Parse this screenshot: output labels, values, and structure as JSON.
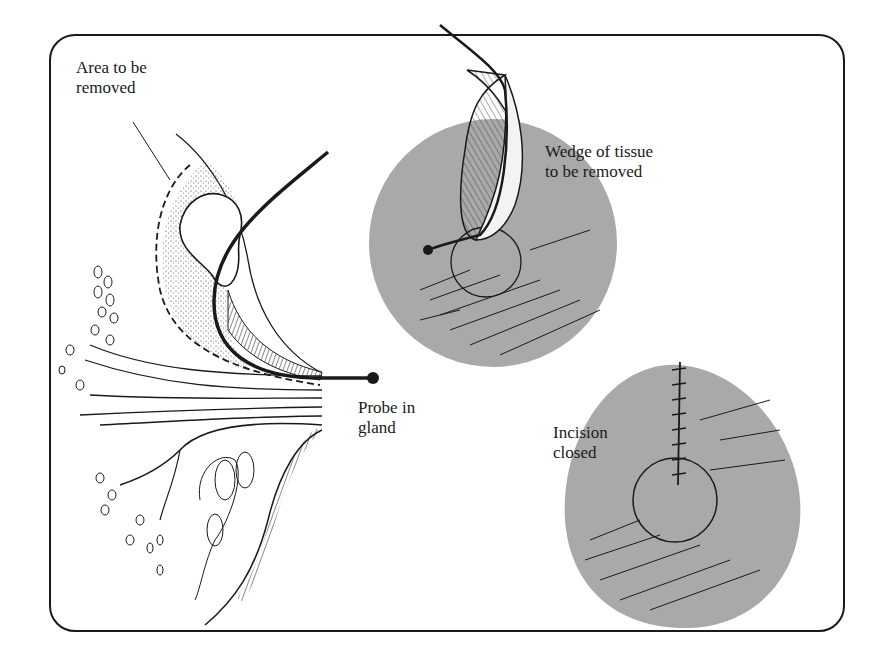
{
  "figure": {
    "panels": [
      {
        "id": "cross-section",
        "description": "Breast cross-section with probe inserted in duct"
      },
      {
        "id": "wedge-excision",
        "description": "Areola view with wedge of tissue being removed"
      },
      {
        "id": "closure",
        "description": "Areola view with sutured incision"
      }
    ],
    "labels": {
      "area_removed": "Area to be\nremoved",
      "wedge": "Wedge of tissue\nto be removed",
      "probe": "Probe in\ngland",
      "incision": "Incision\nclosed"
    },
    "colors": {
      "ink": "#1a1a1a",
      "areola_fill": "#a9a9a9",
      "background": "#ffffff"
    }
  }
}
